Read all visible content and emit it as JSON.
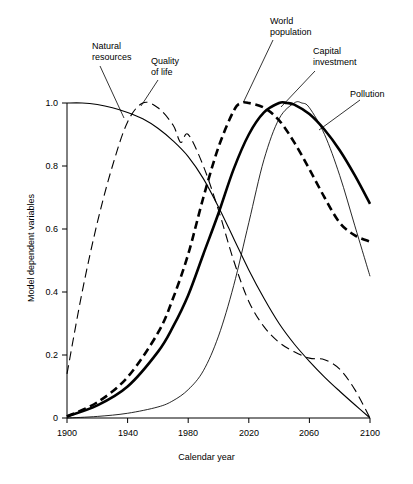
{
  "chart_data": {
    "type": "line",
    "title": "",
    "xlabel": "Calendar year",
    "ylabel": "Model dependent variables",
    "xlim": [
      1900,
      2100
    ],
    "ylim": [
      0,
      1.05
    ],
    "grid": false,
    "legend_position": "inline-annotations",
    "xticks": [
      "1900",
      "1940",
      "1980",
      "2020",
      "2060",
      "2100"
    ],
    "xtick_values": [
      1900,
      1940,
      1980,
      2020,
      2060,
      2100
    ],
    "yticks": [
      "0",
      "0.2",
      "0.4",
      "0.6",
      "0.8",
      "1.0"
    ],
    "ytick_values": [
      0,
      0.2,
      0.4,
      0.6,
      0.8,
      1.0
    ],
    "series": [
      {
        "name": "Natural resources",
        "style": "thin-solid",
        "x": [
          1900,
          1910,
          1920,
          1930,
          1940,
          1950,
          1960,
          1970,
          1980,
          1990,
          2000,
          2010,
          2020,
          2030,
          2040,
          2050,
          2060,
          2070,
          2080,
          2090,
          2100
        ],
        "values": [
          1.0,
          1.0,
          0.995,
          0.985,
          0.97,
          0.95,
          0.92,
          0.88,
          0.83,
          0.76,
          0.67,
          0.57,
          0.47,
          0.38,
          0.3,
          0.235,
          0.18,
          0.13,
          0.085,
          0.042,
          0.0
        ]
      },
      {
        "name": "Quality of life",
        "style": "long-dashed",
        "x": [
          1900,
          1910,
          1920,
          1930,
          1940,
          1950,
          1960,
          1970,
          1975,
          1980,
          1990,
          2000,
          2010,
          2020,
          2030,
          2040,
          2050,
          2060,
          2070,
          2080,
          2090,
          2100
        ],
        "values": [
          0.14,
          0.4,
          0.62,
          0.8,
          0.94,
          1.0,
          0.985,
          0.93,
          0.875,
          0.9,
          0.8,
          0.66,
          0.5,
          0.37,
          0.29,
          0.24,
          0.21,
          0.19,
          0.185,
          0.155,
          0.09,
          0.0
        ]
      },
      {
        "name": "World population",
        "style": "thick-solid",
        "x": [
          1900,
          1920,
          1940,
          1960,
          1970,
          1980,
          1990,
          2000,
          2010,
          2020,
          2030,
          2040,
          2045,
          2050,
          2060,
          2070,
          2080,
          2090,
          2100
        ],
        "values": [
          0.005,
          0.04,
          0.1,
          0.21,
          0.29,
          0.39,
          0.52,
          0.65,
          0.79,
          0.9,
          0.97,
          1.0,
          1.0,
          0.995,
          0.965,
          0.915,
          0.85,
          0.77,
          0.68
        ]
      },
      {
        "name": "Capital investment",
        "style": "thick-dashed",
        "x": [
          1900,
          1920,
          1940,
          1960,
          1970,
          1980,
          1990,
          2000,
          2010,
          2015,
          2020,
          2030,
          2040,
          2050,
          2060,
          2070,
          2080,
          2090,
          2100
        ],
        "values": [
          0.005,
          0.05,
          0.13,
          0.27,
          0.38,
          0.52,
          0.7,
          0.86,
          0.975,
          1.0,
          1.0,
          0.985,
          0.945,
          0.875,
          0.79,
          0.7,
          0.62,
          0.58,
          0.56
        ]
      },
      {
        "name": "Pollution",
        "style": "thin-solid",
        "x": [
          1900,
          1920,
          1940,
          1960,
          1970,
          1980,
          1990,
          2000,
          2010,
          2020,
          2030,
          2040,
          2050,
          2055,
          2060,
          2070,
          2080,
          2090,
          2100
        ],
        "values": [
          0.0,
          0.005,
          0.015,
          0.035,
          0.055,
          0.09,
          0.15,
          0.26,
          0.42,
          0.62,
          0.82,
          0.95,
          1.0,
          1.0,
          0.985,
          0.9,
          0.77,
          0.61,
          0.45
        ]
      }
    ],
    "annotations": [
      {
        "label": "Natural\nresources",
        "series": "Natural resources"
      },
      {
        "label": "Quality\nof life",
        "series": "Quality of life"
      },
      {
        "label": "World\npopulation",
        "series": "World population"
      },
      {
        "label": "Capital\ninvestment",
        "series": "Capital investment"
      },
      {
        "label": "Pollution",
        "series": "Pollution"
      }
    ],
    "colors": {
      "ink": "#000000",
      "background": "#ffffff"
    }
  }
}
